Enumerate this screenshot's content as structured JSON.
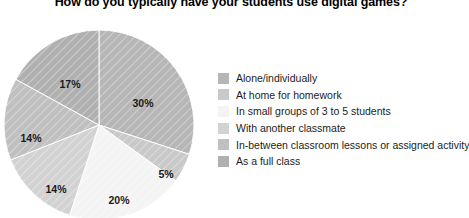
{
  "title": "How do you typically have your students use digital games?",
  "chart_data": {
    "type": "pie",
    "title": "How do you typically have your students use digital games?",
    "xlabel": "",
    "ylabel": "",
    "legend_position": "right",
    "grid": false,
    "categories": [
      "Alone/individually",
      "At home for homework",
      "In small groups of 3 to 5 students",
      "With another classmate",
      "In-between classroom lessons or assigned activity",
      "As a full class"
    ],
    "values": [
      30,
      5,
      20,
      14,
      14,
      17
    ],
    "value_labels": [
      "30%",
      "5%",
      "20%",
      "14%",
      "14%",
      "17%"
    ],
    "colors": [
      "#b6b6b6",
      "#c9c9c9",
      "#f4f4f4",
      "#d2d2d2",
      "#c0c0c0",
      "#b0b0b0"
    ]
  },
  "slices": [
    {
      "label": "30%",
      "value": 30,
      "color": "#b6b6b6",
      "lx": 143,
      "ly": 89
    },
    {
      "label": "5%",
      "value": 5,
      "color": "#c9c9c9",
      "lx": 166,
      "ly": 160
    },
    {
      "label": "20%",
      "value": 20,
      "color": "#f4f4f4",
      "lx": 119,
      "ly": 186
    },
    {
      "label": "14%",
      "value": 14,
      "color": "#d2d2d2",
      "lx": 56,
      "ly": 175
    },
    {
      "label": "14%",
      "value": 14,
      "color": "#c0c0c0",
      "lx": 31,
      "ly": 124
    },
    {
      "label": "17%",
      "value": 17,
      "color": "#b0b0b0",
      "lx": 70,
      "ly": 70
    }
  ],
  "legend": {
    "items": [
      {
        "label": "Alone/individually",
        "color": "#b6b6b6"
      },
      {
        "label": "At home for homework",
        "color": "#c9c9c9"
      },
      {
        "label": "In small groups of 3 to 5 students",
        "color": "#f4f4f4"
      },
      {
        "label": "With another classmate",
        "color": "#d2d2d2"
      },
      {
        "label": "In-between classroom lessons or assigned activity",
        "color": "#c0c0c0"
      },
      {
        "label": "As a full class",
        "color": "#b0b0b0"
      }
    ]
  }
}
